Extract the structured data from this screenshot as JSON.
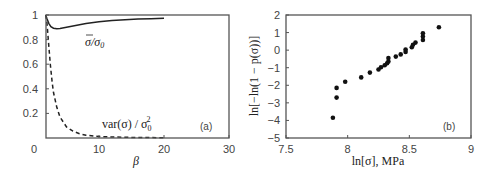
{
  "chart_data": [
    {
      "type": "line",
      "panel_label": "(a)",
      "title": "",
      "xlabel": "β",
      "ylabel": "",
      "xlim": [
        0,
        30
      ],
      "ylim": [
        0,
        1
      ],
      "xticks": [
        "0",
        "10",
        "20",
        "30"
      ],
      "yticks": [
        "0.2",
        "0.4",
        "0.6",
        "0.8",
        "1"
      ],
      "grid": false,
      "series": [
        {
          "name": "σ̄/σ0",
          "label_text": "σ̄/σ₀",
          "style": "solid",
          "x": [
            1.8,
            2.0,
            2.3,
            2.6,
            3.0,
            3.5,
            4.0,
            5,
            6,
            7,
            8,
            10,
            12,
            14,
            16,
            18,
            20
          ],
          "y": [
            1.0,
            0.97,
            0.93,
            0.905,
            0.893,
            0.888,
            0.89,
            0.9,
            0.91,
            0.92,
            0.93,
            0.945,
            0.955,
            0.962,
            0.967,
            0.97,
            0.973
          ]
        },
        {
          "name": "var(σ)/σ0^2",
          "label_text": "var(σ) / σ₀²",
          "style": "dashed",
          "x": [
            1.8,
            2.0,
            2.2,
            2.5,
            2.8,
            3.0,
            3.5,
            4.0,
            5,
            6,
            7,
            8,
            10,
            12,
            14,
            16,
            18,
            20
          ],
          "y": [
            1.0,
            0.93,
            0.8,
            0.6,
            0.45,
            0.37,
            0.25,
            0.17,
            0.09,
            0.055,
            0.035,
            0.022,
            0.012,
            0.008,
            0.006,
            0.004,
            0.003,
            0.002
          ]
        }
      ]
    },
    {
      "type": "scatter",
      "panel_label": "(b)",
      "title": "",
      "xlabel": "ln[σ], MPa",
      "ylabel": "ln[−ln(1 − p(σ))]",
      "xlim": [
        7.5,
        9
      ],
      "ylim": [
        -5,
        2
      ],
      "xticks": [
        "7.5",
        "8",
        "8.5",
        "9"
      ],
      "yticks": [
        "2",
        "1",
        "0",
        "−1",
        "−2",
        "−3",
        "−4",
        "−5"
      ],
      "grid": false,
      "series": [
        {
          "name": "data",
          "x": [
            7.88,
            7.91,
            7.91,
            7.98,
            8.11,
            8.18,
            8.25,
            8.27,
            8.3,
            8.32,
            8.33,
            8.33,
            8.39,
            8.43,
            8.47,
            8.47,
            8.52,
            8.53,
            8.55,
            8.61,
            8.61,
            8.61,
            8.74
          ],
          "y": [
            -3.85,
            -2.7,
            -2.15,
            -1.8,
            -1.55,
            -1.28,
            -1.1,
            -0.97,
            -0.86,
            -0.75,
            -0.64,
            -0.45,
            -0.37,
            -0.24,
            -0.1,
            0.03,
            0.16,
            0.31,
            0.43,
            0.58,
            0.77,
            0.96,
            1.3
          ]
        }
      ]
    }
  ],
  "labels": {
    "a_panel": "(a)",
    "b_panel": "(b)",
    "a_xlabel": "β",
    "a_curve1_main": "σ",
    "a_curve1_rest": "/σ",
    "a_curve1_sub": "0",
    "a_curve2_main": "var(σ) / σ",
    "a_curve2_sub": "0",
    "a_curve2_sup": "2",
    "b_xlabel": "ln[σ], MPa",
    "b_ylabel": "ln[−ln(1 − p(σ))]"
  }
}
